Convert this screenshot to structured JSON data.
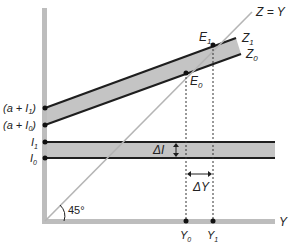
{
  "diagram": {
    "type": "keynesian-cross",
    "colors": {
      "axis": "#bdbdbd",
      "band_fill": "#c4c4c4",
      "line": "#1e1e1e",
      "diagonal": "#b5b5b5",
      "dots": "#111111",
      "guides": "#333333"
    },
    "labels": {
      "diagonal": "Z = Y",
      "z1": "Z",
      "z1_sub": "1",
      "z0": "Z",
      "z0_sub": "0",
      "e1": "E",
      "e1_sub": "1",
      "e0": "E",
      "e0_sub": "0",
      "a_i1_pre": "(a + I",
      "a_i1_sub": "1",
      "a_i1_post": ")",
      "a_i0_pre": "(a + I",
      "a_i0_sub": "0",
      "a_i0_post": ")",
      "i1": "I",
      "i1_sub": "1",
      "i0": "I",
      "i0_sub": "0",
      "delta_i": "ΔI",
      "delta_y": "ΔY",
      "angle": "45°",
      "y_axis_end": "Y",
      "y0": "Y",
      "y0_sub": "0",
      "y1": "Y",
      "y1_sub": "1"
    }
  }
}
